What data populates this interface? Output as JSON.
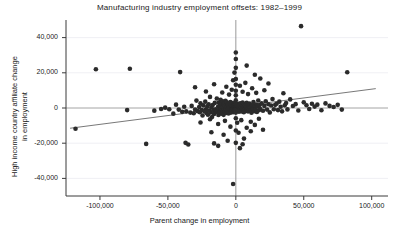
{
  "chart_data": {
    "type": "scatter",
    "title": "Manufacturing industry employment offsets: 1982–1999",
    "xlabel": "Parent change in employment",
    "ylabel_line1": "High income country affiliate change",
    "ylabel_line2": "in employment",
    "xlim": [
      -125000,
      112000
    ],
    "ylim": [
      -50000,
      50000
    ],
    "xticks": [
      -100000,
      -50000,
      0,
      50000,
      100000
    ],
    "xticklabels": [
      "-100,000",
      "-50,000",
      "0",
      "50,000",
      "100,000"
    ],
    "yticks": [
      40000,
      20000,
      0,
      -20000,
      -40000
    ],
    "yticklabels": [
      "40,000",
      "20,000",
      "0",
      "-20,000",
      "-40,000"
    ],
    "grid": "horizontal-light",
    "legend": "none",
    "reference_lines": [
      {
        "name": "vertical-zero-line",
        "orientation": "vertical",
        "value": 0,
        "color": "#999999"
      },
      {
        "name": "horizontal-zero-line",
        "orientation": "horizontal",
        "value": 0,
        "color": "#999999"
      }
    ],
    "fit_line": {
      "name": "regression-line",
      "x_start": -122000,
      "y_start": -11500,
      "x_end": -1000,
      "y_end": 5000,
      "x_end2": 103000,
      "y_end2": 11000,
      "color": "#555555"
    },
    "marker": {
      "color": "#2b2b2b",
      "size": 2.3,
      "shape": "circle"
    },
    "points": [
      [
        -118000,
        -11800
      ],
      [
        -103000,
        22000
      ],
      [
        -80000,
        -1200
      ],
      [
        -78000,
        22300
      ],
      [
        -66000,
        -20400
      ],
      [
        -60000,
        -1500
      ],
      [
        -55000,
        -600
      ],
      [
        -52000,
        200
      ],
      [
        -49000,
        -700
      ],
      [
        -46000,
        -3200
      ],
      [
        -44000,
        1900
      ],
      [
        -42000,
        -900
      ],
      [
        -41000,
        20400
      ],
      [
        -39500,
        -2200
      ],
      [
        -38000,
        700
      ],
      [
        -36500,
        -1900
      ],
      [
        -35000,
        -20700
      ],
      [
        -33500,
        -2600
      ],
      [
        -32500,
        1200
      ],
      [
        -31000,
        -3000
      ],
      [
        -30000,
        -900
      ],
      [
        -29000,
        4200
      ],
      [
        -28000,
        -1800
      ],
      [
        -27000,
        500
      ],
      [
        -26500,
        -2400
      ],
      [
        -26000,
        2700
      ],
      [
        -25000,
        -1200
      ],
      [
        -24500,
        -4300
      ],
      [
        -24000,
        1500
      ],
      [
        -23000,
        -2000
      ],
      [
        -22500,
        3600
      ],
      [
        -22000,
        -800
      ],
      [
        -21500,
        -2900
      ],
      [
        -21000,
        900
      ],
      [
        -20500,
        -3800
      ],
      [
        -20000,
        2100
      ],
      [
        -19500,
        -1400
      ],
      [
        -19000,
        6300
      ],
      [
        -18500,
        -2500
      ],
      [
        -18000,
        400
      ],
      [
        -17500,
        -5100
      ],
      [
        -17000,
        1700
      ],
      [
        -16500,
        -1100
      ],
      [
        -16000,
        -3400
      ],
      [
        -15500,
        2900
      ],
      [
        -15000,
        -700
      ],
      [
        -14500,
        -2200
      ],
      [
        -14000,
        5400
      ],
      [
        -13500,
        -1600
      ],
      [
        -13000,
        800
      ],
      [
        -12800,
        -4000
      ],
      [
        -12500,
        3100
      ],
      [
        -12200,
        -900
      ],
      [
        -12000,
        -2700
      ],
      [
        -11800,
        1300
      ],
      [
        -11500,
        -1900
      ],
      [
        -11200,
        4700
      ],
      [
        -11000,
        -600
      ],
      [
        -10800,
        -3300
      ],
      [
        -10500,
        2200
      ],
      [
        -10200,
        -1200
      ],
      [
        -10000,
        900
      ],
      [
        -9800,
        -2400
      ],
      [
        -9600,
        3800
      ],
      [
        -9400,
        -1500
      ],
      [
        -9200,
        600
      ],
      [
        -9000,
        -3900
      ],
      [
        -8800,
        1800
      ],
      [
        -8600,
        -800
      ],
      [
        -8400,
        2500
      ],
      [
        -8200,
        -2100
      ],
      [
        -8000,
        1100
      ],
      [
        -7800,
        -1300
      ],
      [
        -7600,
        4100
      ],
      [
        -7400,
        -600
      ],
      [
        -7200,
        -2800
      ],
      [
        -7000,
        1600
      ],
      [
        -6800,
        -1000
      ],
      [
        -6600,
        3200
      ],
      [
        -6400,
        -2300
      ],
      [
        -6200,
        700
      ],
      [
        -6000,
        -1700
      ],
      [
        -5800,
        2000
      ],
      [
        -5600,
        -500
      ],
      [
        -5400,
        -3100
      ],
      [
        -5200,
        1400
      ],
      [
        -5000,
        -900
      ],
      [
        -4800,
        2600
      ],
      [
        -4600,
        -2000
      ],
      [
        -4400,
        500
      ],
      [
        -4200,
        -1400
      ],
      [
        -4000,
        3400
      ],
      [
        -3900,
        -700
      ],
      [
        -3800,
        1200
      ],
      [
        -3700,
        -2600
      ],
      [
        -3600,
        1900
      ],
      [
        -3500,
        -1100
      ],
      [
        -3400,
        800
      ],
      [
        -3300,
        -1800
      ],
      [
        -3200,
        2300
      ],
      [
        -3100,
        -400
      ],
      [
        -3000,
        1500
      ],
      [
        -2900,
        -2200
      ],
      [
        -2800,
        600
      ],
      [
        -2700,
        -1300
      ],
      [
        -2600,
        2800
      ],
      [
        -2500,
        -800
      ],
      [
        -2400,
        1000
      ],
      [
        -2300,
        -1900
      ],
      [
        -2200,
        1700
      ],
      [
        -2100,
        -600
      ],
      [
        -2000,
        2100
      ],
      [
        -1950,
        -1500
      ],
      [
        -1900,
        400
      ],
      [
        -1850,
        -2400
      ],
      [
        -1800,
        1300
      ],
      [
        -1750,
        -900
      ],
      [
        -1700,
        2500
      ],
      [
        -1650,
        -1200
      ],
      [
        -1600,
        700
      ],
      [
        -1550,
        -1700
      ],
      [
        -1500,
        1800
      ],
      [
        -1450,
        -500
      ],
      [
        -1400,
        1100
      ],
      [
        -1350,
        -2100
      ],
      [
        -1300,
        900
      ],
      [
        -1250,
        -1400
      ],
      [
        -1200,
        2200
      ],
      [
        -1150,
        -700
      ],
      [
        -1100,
        1400
      ],
      [
        -1050,
        -1800
      ],
      [
        -1000,
        600
      ],
      [
        -950,
        -1000
      ],
      [
        -900,
        1900
      ],
      [
        -850,
        -600
      ],
      [
        -800,
        1200
      ],
      [
        -750,
        -1600
      ],
      [
        -700,
        800
      ],
      [
        -650,
        -1100
      ],
      [
        -600,
        2000
      ],
      [
        -550,
        -400
      ],
      [
        -500,
        1500
      ],
      [
        -450,
        -1300
      ],
      [
        -400,
        700
      ],
      [
        -350,
        -900
      ],
      [
        -300,
        1600
      ],
      [
        -250,
        -500
      ],
      [
        -200,
        1000
      ],
      [
        -150,
        -1200
      ],
      [
        -100,
        500
      ],
      [
        -50,
        -700
      ],
      [
        0,
        1300
      ],
      [
        0,
        27800
      ],
      [
        0,
        31500
      ],
      [
        0,
        22800
      ],
      [
        0,
        16500
      ],
      [
        0,
        13200
      ],
      [
        0,
        9800
      ],
      [
        0,
        7200
      ],
      [
        0,
        4400
      ],
      [
        0,
        2200
      ],
      [
        0,
        -2600
      ],
      [
        0,
        -5800
      ],
      [
        0,
        -12800
      ],
      [
        0,
        -19800
      ],
      [
        500,
        -1000
      ],
      [
        800,
        1700
      ],
      [
        1100,
        -600
      ],
      [
        1400,
        2400
      ],
      [
        1700,
        -1500
      ],
      [
        2000,
        900
      ],
      [
        2300,
        -2100
      ],
      [
        2600,
        1400
      ],
      [
        2900,
        -800
      ],
      [
        3200,
        2700
      ],
      [
        3500,
        -1300
      ],
      [
        3800,
        600
      ],
      [
        4100,
        -1900
      ],
      [
        4400,
        1800
      ],
      [
        4700,
        -500
      ],
      [
        5000,
        3100
      ],
      [
        5300,
        -1100
      ],
      [
        5600,
        1000
      ],
      [
        5900,
        -2400
      ],
      [
        6200,
        2200
      ],
      [
        6500,
        -700
      ],
      [
        6800,
        1500
      ],
      [
        7100,
        -1700
      ],
      [
        7400,
        800
      ],
      [
        7700,
        -1200
      ],
      [
        8000,
        2900
      ],
      [
        8300,
        -600
      ],
      [
        8600,
        1300
      ],
      [
        9000,
        -2000
      ],
      [
        9400,
        1900
      ],
      [
        9800,
        -900
      ],
      [
        10200,
        2500
      ],
      [
        10600,
        -1400
      ],
      [
        11000,
        700
      ],
      [
        11500,
        -2700
      ],
      [
        12000,
        1600
      ],
      [
        12500,
        -500
      ],
      [
        13000,
        3400
      ],
      [
        13500,
        -1800
      ],
      [
        14000,
        1100
      ],
      [
        14500,
        -1000
      ],
      [
        15000,
        2000
      ],
      [
        15500,
        -2300
      ],
      [
        16000,
        900
      ],
      [
        16500,
        4300
      ],
      [
        17000,
        -1300
      ],
      [
        17500,
        1700
      ],
      [
        18000,
        -600
      ],
      [
        19000,
        2600
      ],
      [
        20000,
        -1600
      ],
      [
        21000,
        1200
      ],
      [
        22000,
        3800
      ],
      [
        23000,
        -900
      ],
      [
        24000,
        2100
      ],
      [
        25000,
        -2500
      ],
      [
        26000,
        1400
      ],
      [
        27000,
        5100
      ],
      [
        28000,
        -700
      ],
      [
        29000,
        1800
      ],
      [
        30000,
        2400
      ],
      [
        31000,
        -1200
      ],
      [
        32000,
        3600
      ],
      [
        33000,
        700
      ],
      [
        34000,
        -1900
      ],
      [
        35000,
        8400
      ],
      [
        36000,
        1500
      ],
      [
        37000,
        2800
      ],
      [
        38000,
        -800
      ],
      [
        40000,
        4900
      ],
      [
        42000,
        1100
      ],
      [
        44000,
        2200
      ],
      [
        46000,
        -1400
      ],
      [
        48000,
        46500
      ],
      [
        50000,
        3200
      ],
      [
        52000,
        1600
      ],
      [
        54000,
        -600
      ],
      [
        56000,
        2400
      ],
      [
        58000,
        800
      ],
      [
        60000,
        1900
      ],
      [
        63000,
        -1300
      ],
      [
        66000,
        2600
      ],
      [
        69000,
        1200
      ],
      [
        72000,
        600
      ],
      [
        75000,
        1800
      ],
      [
        78000,
        -900
      ],
      [
        82000,
        20300
      ],
      [
        -30000,
        11800
      ],
      [
        -22000,
        9400
      ],
      [
        -16000,
        13500
      ],
      [
        -10000,
        8800
      ],
      [
        -7000,
        12100
      ],
      [
        -5000,
        7600
      ],
      [
        -3000,
        10400
      ],
      [
        -2000,
        15800
      ],
      [
        3000,
        12600
      ],
      [
        5000,
        9200
      ],
      [
        7000,
        14300
      ],
      [
        9000,
        7900
      ],
      [
        12000,
        11200
      ],
      [
        15000,
        8600
      ],
      [
        18000,
        16800
      ],
      [
        21000,
        10100
      ],
      [
        24000,
        13900
      ],
      [
        8000,
        24100
      ],
      [
        14000,
        18900
      ],
      [
        -1000,
        20100
      ],
      [
        -26000,
        -8200
      ],
      [
        -19000,
        -6400
      ],
      [
        -13000,
        -9100
      ],
      [
        -8000,
        -7300
      ],
      [
        -4000,
        -10600
      ],
      [
        1000,
        -8400
      ],
      [
        4000,
        -6900
      ],
      [
        8000,
        -11200
      ],
      [
        11000,
        -7800
      ],
      [
        14000,
        -9600
      ],
      [
        17000,
        -6100
      ],
      [
        20000,
        -12400
      ],
      [
        -18000,
        -13800
      ],
      [
        -9000,
        -15200
      ],
      [
        2000,
        -14100
      ],
      [
        11000,
        -13200
      ],
      [
        -6000,
        -18600
      ],
      [
        6000,
        -17400
      ],
      [
        -13000,
        -21500
      ],
      [
        3000,
        -22800
      ],
      [
        -2000,
        -43200
      ],
      [
        -37000,
        -19800
      ],
      [
        -16000,
        -20100
      ],
      [
        5000,
        -20600
      ]
    ]
  }
}
